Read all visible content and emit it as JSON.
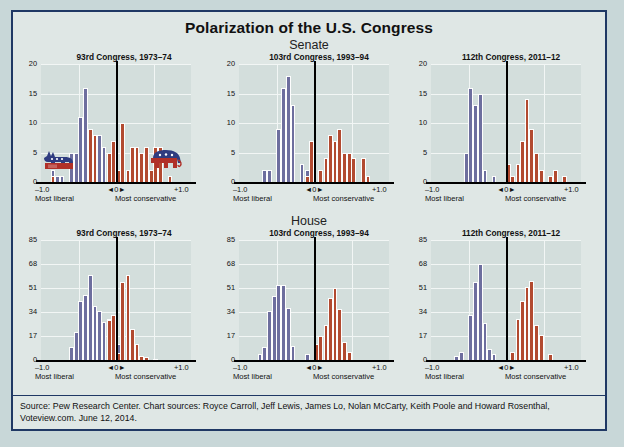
{
  "title": "Polarization of the U.S. Congress",
  "sections": [
    {
      "name": "Senate"
    },
    {
      "name": "House"
    }
  ],
  "axis_labels": {
    "left": "–1.0",
    "right": "+1.0",
    "center": "◄0►",
    "left_sub": "Most liberal",
    "right_sub": "Most conservative"
  },
  "colors": {
    "democrat": "#6d6e9e",
    "republican": "#b24a30",
    "border": "#1f3864",
    "background": "#dfe7e5",
    "plot_background": "#d3dedc"
  },
  "icons": {
    "donkey": "donkey-icon",
    "elephant": "elephant-icon"
  },
  "footer": "Source: Pew Research Center. Chart sources: Royce Carroll, Jeff Lewis, James Lo, Nolan McCarty, Keith Poole and Howard Rosenthal, Voteview.com. June 12, 2014.",
  "chart_data": [
    {
      "type": "bar",
      "chamber": "Senate",
      "title": "93rd Congress, 1973–74",
      "xlabel": "",
      "ylabel": "",
      "xlim": [
        -1.0,
        1.0
      ],
      "ylim": [
        0,
        20
      ],
      "yticks": [
        0,
        5,
        10,
        15,
        20
      ],
      "xticks": [
        "–1.0",
        "◄0►",
        "+1.0"
      ],
      "grid": true,
      "bin_width": 0.0625,
      "series": [
        {
          "name": "Democrats",
          "color": "#6d6e9e",
          "bins": [
            {
              "x": -0.84,
              "v": 2
            },
            {
              "x": -0.78,
              "v": 1
            },
            {
              "x": -0.72,
              "v": 1
            },
            {
              "x": -0.59,
              "v": 5
            },
            {
              "x": -0.53,
              "v": 5
            },
            {
              "x": -0.47,
              "v": 11
            },
            {
              "x": -0.41,
              "v": 16
            },
            {
              "x": -0.34,
              "v": 9
            },
            {
              "x": -0.28,
              "v": 8
            },
            {
              "x": -0.22,
              "v": 8
            },
            {
              "x": -0.16,
              "v": 6
            },
            {
              "x": -0.09,
              "v": 4
            },
            {
              "x": -0.03,
              "v": 4
            },
            {
              "x": 0.03,
              "v": 1
            }
          ]
        },
        {
          "name": "Republicans",
          "color": "#b24a30",
          "bins": [
            {
              "x": -0.84,
              "v": 1
            },
            {
              "x": -0.34,
              "v": 9
            },
            {
              "x": -0.28,
              "v": 8
            },
            {
              "x": -0.09,
              "v": 5
            },
            {
              "x": -0.03,
              "v": 7
            },
            {
              "x": 0.03,
              "v": 2
            },
            {
              "x": 0.09,
              "v": 10
            },
            {
              "x": 0.16,
              "v": 2
            },
            {
              "x": 0.22,
              "v": 6
            },
            {
              "x": 0.28,
              "v": 6
            },
            {
              "x": 0.34,
              "v": 5
            },
            {
              "x": 0.41,
              "v": 6
            },
            {
              "x": 0.47,
              "v": 2
            },
            {
              "x": 0.53,
              "v": 6
            },
            {
              "x": 0.59,
              "v": 6
            },
            {
              "x": 0.72,
              "v": 1
            }
          ]
        }
      ]
    },
    {
      "type": "bar",
      "chamber": "Senate",
      "title": "103rd Congress, 1993–94",
      "xlabel": "",
      "ylabel": "",
      "xlim": [
        -1.0,
        1.0
      ],
      "ylim": [
        0,
        20
      ],
      "yticks": [
        0,
        5,
        10,
        15,
        20
      ],
      "xticks": [
        "–1.0",
        "◄0►",
        "+1.0"
      ],
      "grid": true,
      "bin_width": 0.0625,
      "series": [
        {
          "name": "Democrats",
          "color": "#6d6e9e",
          "bins": [
            {
              "x": -0.66,
              "v": 2
            },
            {
              "x": -0.59,
              "v": 2
            },
            {
              "x": -0.47,
              "v": 9
            },
            {
              "x": -0.41,
              "v": 16
            },
            {
              "x": -0.34,
              "v": 18
            },
            {
              "x": -0.28,
              "v": 13
            },
            {
              "x": -0.16,
              "v": 3
            },
            {
              "x": -0.09,
              "v": 2
            },
            {
              "x": -0.03,
              "v": 1
            }
          ]
        },
        {
          "name": "Republicans",
          "color": "#b24a30",
          "bins": [
            {
              "x": -0.09,
              "v": 1
            },
            {
              "x": -0.03,
              "v": 7
            },
            {
              "x": 0.09,
              "v": 2
            },
            {
              "x": 0.16,
              "v": 4
            },
            {
              "x": 0.22,
              "v": 8
            },
            {
              "x": 0.28,
              "v": 7
            },
            {
              "x": 0.34,
              "v": 9
            },
            {
              "x": 0.41,
              "v": 5
            },
            {
              "x": 0.47,
              "v": 5
            },
            {
              "x": 0.53,
              "v": 4
            },
            {
              "x": 0.66,
              "v": 4
            },
            {
              "x": 0.72,
              "v": 1
            }
          ]
        }
      ]
    },
    {
      "type": "bar",
      "chamber": "Senate",
      "title": "112th Congress, 2011–12",
      "xlabel": "",
      "ylabel": "",
      "xlim": [
        -1.0,
        1.0
      ],
      "ylim": [
        0,
        20
      ],
      "yticks": [
        0,
        5,
        10,
        15,
        20
      ],
      "xticks": [
        "–1.0",
        "◄0►",
        "+1.0"
      ],
      "grid": true,
      "bin_width": 0.0625,
      "series": [
        {
          "name": "Democrats",
          "color": "#6d6e9e",
          "bins": [
            {
              "x": -0.53,
              "v": 5
            },
            {
              "x": -0.47,
              "v": 16
            },
            {
              "x": -0.41,
              "v": 13
            },
            {
              "x": -0.34,
              "v": 15
            },
            {
              "x": -0.28,
              "v": 2
            },
            {
              "x": -0.16,
              "v": 1
            }
          ]
        },
        {
          "name": "Republicans",
          "color": "#b24a30",
          "bins": [
            {
              "x": 0.03,
              "v": 3
            },
            {
              "x": 0.09,
              "v": 1
            },
            {
              "x": 0.16,
              "v": 3
            },
            {
              "x": 0.22,
              "v": 7
            },
            {
              "x": 0.28,
              "v": 14
            },
            {
              "x": 0.34,
              "v": 9
            },
            {
              "x": 0.41,
              "v": 5
            },
            {
              "x": 0.47,
              "v": 2
            },
            {
              "x": 0.59,
              "v": 1
            },
            {
              "x": 0.66,
              "v": 2
            },
            {
              "x": 0.78,
              "v": 1
            }
          ]
        }
      ]
    },
    {
      "type": "bar",
      "chamber": "House",
      "title": "93rd Congress, 1973–74",
      "xlabel": "",
      "ylabel": "",
      "xlim": [
        -1.0,
        1.0
      ],
      "ylim": [
        0,
        85
      ],
      "yticks": [
        0,
        17,
        34,
        51,
        68,
        85
      ],
      "xticks": [
        "–1.0",
        "◄0►",
        "+1.0"
      ],
      "grid": true,
      "bin_width": 0.0625,
      "series": [
        {
          "name": "Democrats",
          "color": "#6d6e9e",
          "bins": [
            {
              "x": -0.59,
              "v": 9
            },
            {
              "x": -0.53,
              "v": 20
            },
            {
              "x": -0.47,
              "v": 42
            },
            {
              "x": -0.41,
              "v": 46
            },
            {
              "x": -0.34,
              "v": 60
            },
            {
              "x": -0.28,
              "v": 38
            },
            {
              "x": -0.22,
              "v": 35
            },
            {
              "x": -0.16,
              "v": 27
            },
            {
              "x": -0.09,
              "v": 29
            },
            {
              "x": -0.03,
              "v": 19
            },
            {
              "x": 0.03,
              "v": 11
            }
          ]
        },
        {
          "name": "Republicans",
          "color": "#b24a30",
          "bins": [
            {
              "x": -0.09,
              "v": 28
            },
            {
              "x": -0.03,
              "v": 32
            },
            {
              "x": 0.03,
              "v": 5
            },
            {
              "x": 0.09,
              "v": 55
            },
            {
              "x": 0.16,
              "v": 60
            },
            {
              "x": 0.22,
              "v": 22
            },
            {
              "x": 0.28,
              "v": 11
            },
            {
              "x": 0.34,
              "v": 3
            },
            {
              "x": 0.41,
              "v": 2
            },
            {
              "x": 0.53,
              "v": 1
            }
          ]
        }
      ]
    },
    {
      "type": "bar",
      "chamber": "House",
      "title": "103rd Congress, 1993–94",
      "xlabel": "",
      "ylabel": "",
      "xlim": [
        -1.0,
        1.0
      ],
      "ylim": [
        0,
        85
      ],
      "yticks": [
        0,
        17,
        34,
        51,
        68,
        85
      ],
      "xticks": [
        "–1.0",
        "◄0►",
        "+1.0"
      ],
      "grid": true,
      "bin_width": 0.0625,
      "series": [
        {
          "name": "Democrats",
          "color": "#6d6e9e",
          "bins": [
            {
              "x": -0.72,
              "v": 4
            },
            {
              "x": -0.66,
              "v": 9
            },
            {
              "x": -0.59,
              "v": 35
            },
            {
              "x": -0.53,
              "v": 45
            },
            {
              "x": -0.47,
              "v": 53
            },
            {
              "x": -0.41,
              "v": 53
            },
            {
              "x": -0.34,
              "v": 37
            },
            {
              "x": -0.28,
              "v": 10
            },
            {
              "x": -0.09,
              "v": 4
            }
          ]
        },
        {
          "name": "Republicans",
          "color": "#b24a30",
          "bins": [
            {
              "x": 0.03,
              "v": 11
            },
            {
              "x": 0.09,
              "v": 17
            },
            {
              "x": 0.16,
              "v": 25
            },
            {
              "x": 0.22,
              "v": 44
            },
            {
              "x": 0.28,
              "v": 51
            },
            {
              "x": 0.34,
              "v": 36
            },
            {
              "x": 0.41,
              "v": 13
            },
            {
              "x": 0.47,
              "v": 6
            }
          ]
        }
      ]
    },
    {
      "type": "bar",
      "chamber": "House",
      "title": "112th Congress, 2011–12",
      "xlabel": "",
      "ylabel": "",
      "xlim": [
        -1.0,
        1.0
      ],
      "ylim": [
        0,
        85
      ],
      "yticks": [
        0,
        17,
        34,
        51,
        68,
        85
      ],
      "xticks": [
        "–1.0",
        "◄0►",
        "+1.0"
      ],
      "grid": true,
      "bin_width": 0.0625,
      "series": [
        {
          "name": "Democrats",
          "color": "#6d6e9e",
          "bins": [
            {
              "x": -0.66,
              "v": 3
            },
            {
              "x": -0.59,
              "v": 6
            },
            {
              "x": -0.47,
              "v": 32
            },
            {
              "x": -0.41,
              "v": 55
            },
            {
              "x": -0.34,
              "v": 68
            },
            {
              "x": -0.28,
              "v": 26
            },
            {
              "x": -0.22,
              "v": 8
            },
            {
              "x": -0.16,
              "v": 4
            }
          ]
        },
        {
          "name": "Republicans",
          "color": "#b24a30",
          "bins": [
            {
              "x": 0.09,
              "v": 6
            },
            {
              "x": 0.16,
              "v": 29
            },
            {
              "x": 0.22,
              "v": 42
            },
            {
              "x": 0.28,
              "v": 52
            },
            {
              "x": 0.34,
              "v": 56
            },
            {
              "x": 0.41,
              "v": 25
            },
            {
              "x": 0.47,
              "v": 18
            },
            {
              "x": 0.59,
              "v": 4
            }
          ]
        }
      ]
    }
  ]
}
